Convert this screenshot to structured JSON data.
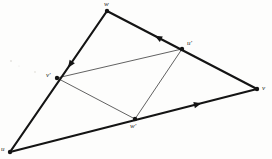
{
  "figure": {
    "background_color": "#fdfdfc",
    "stroke_color": "#141414",
    "thin_stroke_color": "#3a3a3a",
    "outer_stroke_width": 2.2,
    "inner_stroke_width": 0.8,
    "vertex_dot_radius": 2.2
  },
  "vertices": [
    {
      "id": "u",
      "label": "u",
      "x": 10,
      "y": 152,
      "label_x": 1,
      "label_y": 146,
      "kind": "outer"
    },
    {
      "id": "w",
      "label": "w",
      "x": 107,
      "y": 11,
      "label_x": 104,
      "label_y": 1,
      "kind": "outer"
    },
    {
      "id": "v",
      "label": "v",
      "x": 257,
      "y": 89,
      "label_x": 262,
      "label_y": 85,
      "kind": "outer"
    },
    {
      "id": "up",
      "label": "u′",
      "x": 182,
      "y": 49,
      "label_x": 187,
      "label_y": 40,
      "kind": "midpoint"
    },
    {
      "id": "vp",
      "label": "v′",
      "x": 57,
      "y": 78,
      "label_x": 46,
      "label_y": 72,
      "kind": "midpoint"
    },
    {
      "id": "wp",
      "label": "w′",
      "x": 135,
      "y": 119,
      "label_x": 130,
      "label_y": 123,
      "kind": "midpoint"
    }
  ],
  "outer_edges": [
    {
      "id": "edge-u-w",
      "from": "u",
      "to": "w",
      "arrow": true,
      "arrow_t": 0.62,
      "arrow_direction": "toward-u"
    },
    {
      "id": "edge-w-v",
      "from": "w",
      "to": "v",
      "arrow": true,
      "arrow_t": 0.34,
      "arrow_direction": "toward-w"
    },
    {
      "id": "edge-u-v",
      "from": "u",
      "to": "v",
      "arrow": true,
      "arrow_t": 0.76,
      "arrow_direction": "toward-v"
    }
  ],
  "inner_edges": [
    {
      "id": "edge-vp-up",
      "from": "vp",
      "to": "up"
    },
    {
      "id": "edge-vp-wp",
      "from": "vp",
      "to": "wp"
    },
    {
      "id": "edge-wp-up",
      "from": "wp",
      "to": "up"
    }
  ],
  "specks": [
    {
      "x": 11,
      "y": 61,
      "r": 1.1
    },
    {
      "x": 35,
      "y": 72,
      "r": 0.9
    },
    {
      "x": 19,
      "y": 66,
      "r": 0.6
    }
  ]
}
